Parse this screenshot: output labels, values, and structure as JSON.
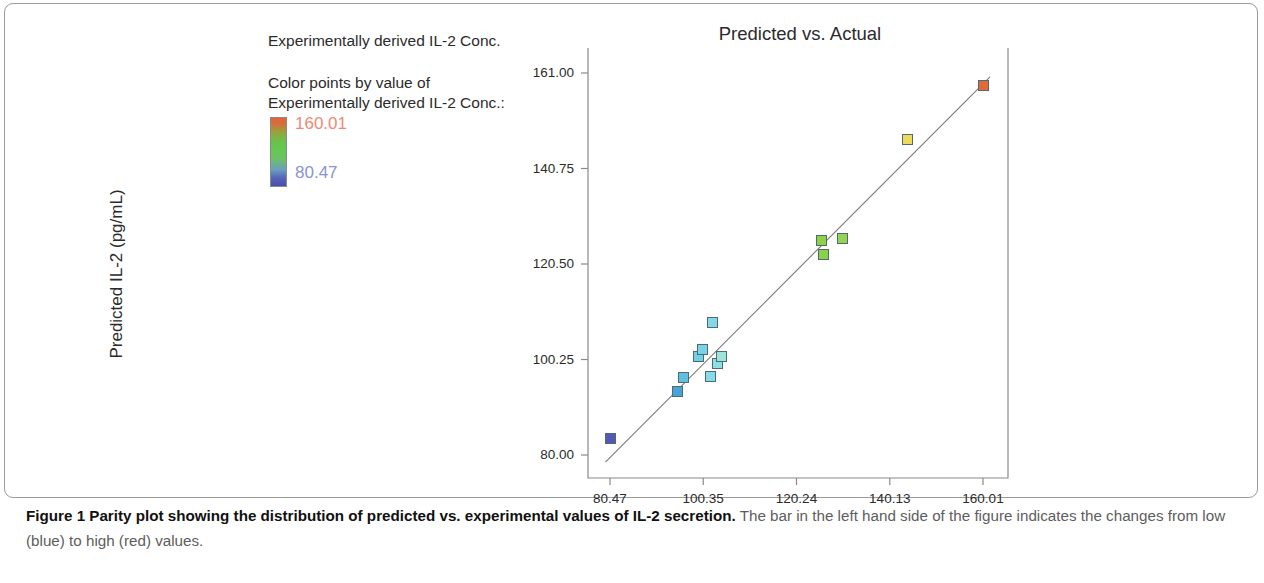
{
  "legend": {
    "header": "Experimentally derived IL-2 Conc.",
    "sub_line_1": "Color points by value of",
    "sub_line_2": "Experimentally derived IL-2 Conc.:",
    "max_value": "160.01",
    "min_value": "80.47",
    "max_color": "#ef8a72",
    "min_color": "#8b93d6",
    "gradient_top_color": "#e8603c",
    "gradient_mid_color": "#63c855",
    "gradient_bottom_color": "#4a4fae"
  },
  "caption": {
    "bold": "Figure 1 Parity plot showing the distribution of predicted vs. experimental values of IL-2 secretion.",
    "rest": " The bar in the left hand side of the figure indicates the changes from low (blue) to high (red) values."
  },
  "chart_data": {
    "type": "scatter",
    "title": "Predicted vs. Actual",
    "xlabel": "",
    "ylabel": "Predicted IL-2 (pg/mL)",
    "xticks": [
      "80.47",
      "100.35",
      "120.24",
      "140.13",
      "160.01"
    ],
    "yticks": [
      "161.00",
      "140.75",
      "120.50",
      "100.25",
      "80.00"
    ],
    "xlim": [
      80.47,
      160.01
    ],
    "ylim": [
      80.0,
      161.0
    ],
    "grid": false,
    "legend_position": "left-outside",
    "reference_line": {
      "label": "parity line",
      "x": [
        79.5,
        161.5
      ],
      "y": [
        78.5,
        160.2
      ],
      "color": "#7a7a7a"
    },
    "points": [
      {
        "x": 80.47,
        "y": 83.5,
        "color": "#5358b4"
      },
      {
        "x": 94.8,
        "y": 93.4,
        "color": "#4aa3d8"
      },
      {
        "x": 96.2,
        "y": 96.4,
        "color": "#5cc0de"
      },
      {
        "x": 99.4,
        "y": 100.9,
        "color": "#6fd0e6"
      },
      {
        "x": 100.1,
        "y": 102.4,
        "color": "#7ad4e8"
      },
      {
        "x": 102.0,
        "y": 96.6,
        "color": "#86dbea"
      },
      {
        "x": 102.3,
        "y": 108.2,
        "color": "#84d8ea"
      },
      {
        "x": 103.5,
        "y": 99.3,
        "color": "#8ce0e4"
      },
      {
        "x": 104.2,
        "y": 100.8,
        "color": "#9ee4da"
      },
      {
        "x": 125.6,
        "y": 125.5,
        "color": "#8ed24a"
      },
      {
        "x": 125.9,
        "y": 122.6,
        "color": "#8bd04c"
      },
      {
        "x": 130.0,
        "y": 126.0,
        "color": "#93d455"
      },
      {
        "x": 144.0,
        "y": 147.0,
        "color": "#eddb5e"
      },
      {
        "x": 160.01,
        "y": 158.4,
        "color": "#e06a38"
      }
    ]
  },
  "axis_geometry": {
    "plot_left_px": 588,
    "plot_right_px": 1008,
    "plot_top_px": 48,
    "plot_bottom_px": 478,
    "x_min_px": 610,
    "x_max_px": 983,
    "y_min_px": 455,
    "y_max_px": 73
  }
}
